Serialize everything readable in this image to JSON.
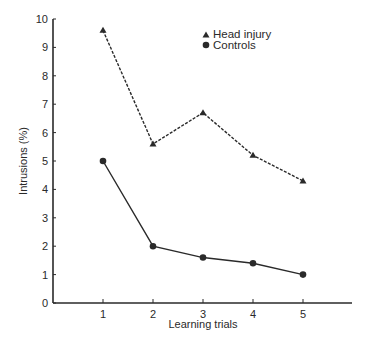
{
  "chart_data": {
    "type": "line",
    "title": "",
    "xlabel": "Learning trials",
    "ylabel": "Intrusions (%)",
    "x": [
      1,
      2,
      3,
      4,
      5
    ],
    "xlim": [
      0,
      6
    ],
    "ylim": [
      0,
      10
    ],
    "xticks": [
      "1",
      "2",
      "3",
      "4",
      "5"
    ],
    "yticks": [
      "0",
      "1",
      "2",
      "3",
      "4",
      "5",
      "6",
      "7",
      "8",
      "9",
      "10"
    ],
    "grid": false,
    "legend_position": "top-center",
    "series": [
      {
        "name": "Head injury",
        "marker": "triangle",
        "line_style": "dashed",
        "values": [
          9.6,
          5.6,
          6.7,
          5.2,
          4.3
        ]
      },
      {
        "name": "Controls",
        "marker": "circle",
        "line_style": "solid",
        "values": [
          5.0,
          2.0,
          1.6,
          1.4,
          1.0
        ]
      }
    ]
  },
  "colors": {
    "ink": "#2a2a2a",
    "background": "#ffffff"
  }
}
